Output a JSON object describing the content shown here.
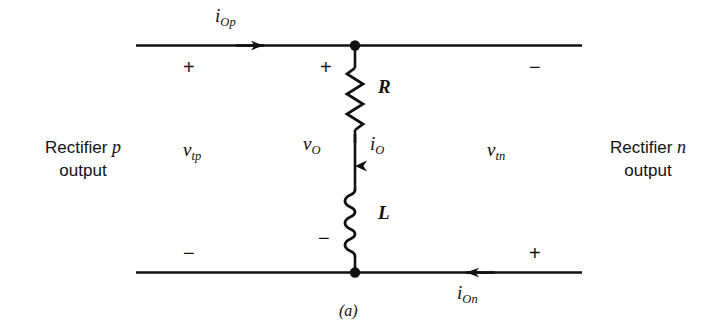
{
  "figure": {
    "caption": "(a)",
    "type": "circuit-diagram"
  },
  "blocks": {
    "left": {
      "line1_prefix": "Rectifier ",
      "line1_symbol": "p",
      "line2": "output"
    },
    "right": {
      "line1_prefix": "Rectifier ",
      "line1_symbol": "n",
      "line2": "output"
    }
  },
  "currents": {
    "top": {
      "symbol": "i",
      "subscript": "Op",
      "direction": "right"
    },
    "bottom": {
      "symbol": "i",
      "subscript": "On",
      "direction": "left"
    },
    "branch": {
      "symbol": "i",
      "subscript": "O",
      "direction": "down"
    }
  },
  "voltages": {
    "left_terminal": {
      "symbol": "v",
      "subscript": "tp"
    },
    "right_terminal": {
      "symbol": "v",
      "subscript": "tn"
    },
    "output": {
      "symbol": "v",
      "subscript": "O"
    }
  },
  "components": [
    {
      "id": "resistor",
      "label": "R",
      "type": "resistor"
    },
    {
      "id": "inductor",
      "label": "L",
      "type": "inductor",
      "turns": 3
    }
  ],
  "polarity_marks": {
    "top_left": "+",
    "top_right": "−",
    "branch_top": "+",
    "branch_bottom": "−",
    "bottom_left": "−",
    "bottom_right": "+"
  },
  "colors": {
    "ink": "#111111",
    "background": "#ffffff"
  }
}
